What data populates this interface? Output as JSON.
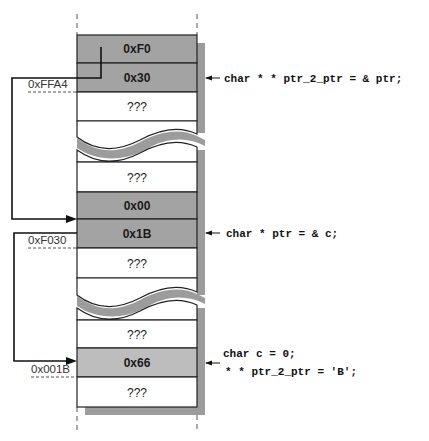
{
  "colors": {
    "pointer_cell": "#a3a3a3",
    "value_cell": "#bdbdbd",
    "empty_cell": "#ffffff",
    "shadow": "#9c9c9c",
    "line": "#222222"
  },
  "memory": {
    "block1": {
      "cells": [
        {
          "label": "0xF0",
          "kind": "pointer"
        },
        {
          "label": "0x30",
          "kind": "pointer"
        },
        {
          "label": "???",
          "kind": "empty"
        }
      ],
      "address_label": "0xFFA4"
    },
    "block2": {
      "cells": [
        {
          "label": "???",
          "kind": "empty"
        },
        {
          "label": "0x00",
          "kind": "pointer"
        },
        {
          "label": "0x1B",
          "kind": "pointer"
        },
        {
          "label": "???",
          "kind": "empty"
        }
      ],
      "address_label": "0xF030"
    },
    "block3": {
      "cells": [
        {
          "label": "???",
          "kind": "empty"
        },
        {
          "label": "0x66",
          "kind": "value"
        },
        {
          "label": "???",
          "kind": "empty"
        }
      ],
      "address_label": "0x001B"
    }
  },
  "code": {
    "ptr_2_ptr": "char * * ptr_2_ptr = & ptr;",
    "ptr": "char * ptr = & c;",
    "c_line1": "char c = 0;",
    "c_line2": "* * ptr_2_ptr = 'B';"
  }
}
